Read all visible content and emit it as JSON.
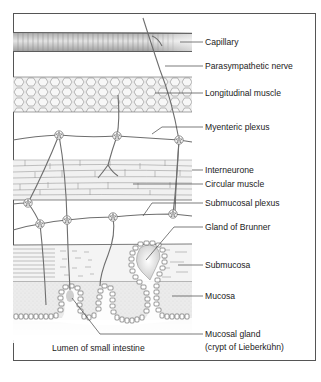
{
  "diagram": {
    "type": "anatomical cross-section",
    "labels": {
      "capillary": "Capillary",
      "parasympathetic_nerve": "Parasympathetic nerve",
      "longitudinal_muscle": "Longitudinal muscle",
      "myenteric_plexus": "Myenteric plexus",
      "interneurone": "Interneurone",
      "circular_muscle": "Circular muscle",
      "submucosal_plexus": "Submucosal plexus",
      "gland_of_brunner": "Gland of Brunner",
      "submucosa": "Submucosa",
      "mucosa": "Mucosa",
      "mucosal_gland_line1": "Mucosal gland",
      "mucosal_gland_line2": "(crypt of Lieberkühn)",
      "lumen": "Lumen of small intestine"
    },
    "colors": {
      "frame": "#555555",
      "nerve": "#6e6e6e",
      "capillary_fill": "#c8c8c8",
      "muscle_fill": "#e6e6e6",
      "mucosa_fill": "#ececec",
      "submucosa_fill": "#f2f2f2",
      "gland_lumen": "#dcdcdc",
      "text": "#222222"
    }
  }
}
